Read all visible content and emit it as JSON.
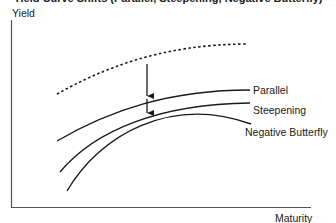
{
  "title": "Yield Curve Shifts (Parallel, Steepening, Negative Butterfly)",
  "axes": {
    "y_label": "Yield",
    "x_label": "Maturity"
  },
  "curves": [
    {
      "name": "Original",
      "style": "dotted",
      "label": ""
    },
    {
      "name": "Parallel",
      "style": "solid",
      "label": "Parallel"
    },
    {
      "name": "Steepening",
      "style": "solid",
      "label": "Steepening"
    },
    {
      "name": "Negative Butterfly",
      "style": "solid",
      "label": "Negative Butterfly"
    }
  ],
  "arrows": [
    {
      "from": "Original",
      "to": "Parallel",
      "direction": "down"
    },
    {
      "from": "Parallel",
      "to": "Steepening",
      "direction": "down"
    }
  ],
  "colors": {
    "line": "#1a1a1a",
    "background": "#ffffff"
  }
}
